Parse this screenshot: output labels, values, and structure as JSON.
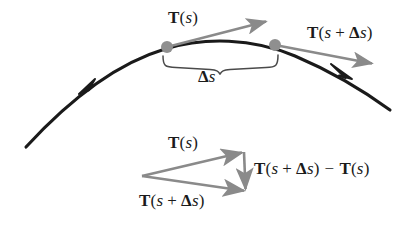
{
  "figure": {
    "name": "tangent-vector-change-along-curve",
    "background_color": "#ffffff",
    "curve_color": "#1a1a1a",
    "vector_color": "#8a8a8a",
    "point_color": "#8f8f8f",
    "brace_color": "#4a4a4a",
    "text_color": "#1b1b1b"
  },
  "labels": {
    "tangent_at_s_curve": {
      "vec": "T",
      "open": "(",
      "arg": "s",
      "close": ")",
      "full_text": "T(s)"
    },
    "tangent_at_s_plus_ds_curve": {
      "vec": "T",
      "open": "(",
      "arg": "s",
      "plus": "+",
      "delta": "Δ",
      "arg2": "s",
      "close": ")",
      "full_text": "T(s + Δs)"
    },
    "arc_length": {
      "delta": "Δ",
      "var": "s",
      "full_text": "Δs"
    },
    "tangent_at_s_triangle": {
      "vec": "T",
      "open": "(",
      "arg": "s",
      "close": ")",
      "full_text": "T(s)"
    },
    "tangent_at_s_plus_ds_triangle": {
      "vec": "T",
      "open": "(",
      "arg": "s",
      "plus": "+",
      "delta": "Δ",
      "arg2": "s",
      "close": ")",
      "full_text": "T(s + Δs)"
    },
    "tangent_difference": {
      "vec1": "T",
      "open1": "(",
      "arg1": "s",
      "plus": "+",
      "delta": "Δ",
      "arg1b": "s",
      "close1": ")",
      "minus": "−",
      "vec2": "T",
      "open2": "(",
      "arg2": "s",
      "close2": ")",
      "full_text": "T(s + Δs) − T(s)"
    }
  },
  "geometry": {
    "curve": {
      "start": [
        26,
        147
      ],
      "apex": [
        240,
        41
      ],
      "end": [
        390,
        110
      ],
      "direction_arrow_at": [
        88,
        84
      ],
      "second_arrow_at": [
        344,
        73
      ]
    },
    "points": [
      {
        "name": "point-at-s",
        "x": 167,
        "y": 47,
        "r": 6
      },
      {
        "name": "point-at-s-plus-ds",
        "x": 275,
        "y": 45,
        "r": 6
      }
    ],
    "vectors": [
      {
        "name": "tangent-vector-at-s",
        "from": [
          167,
          47
        ],
        "to": [
          268,
          21
        ]
      },
      {
        "name": "tangent-vector-at-s-plus-ds",
        "from": [
          275,
          45
        ],
        "to": [
          374,
          64
        ]
      },
      {
        "name": "triangle-tangent-at-s",
        "from": [
          142,
          176
        ],
        "to": [
          244,
          152
        ]
      },
      {
        "name": "triangle-tangent-at-s-plus-ds",
        "from": [
          142,
          176
        ],
        "to": [
          246,
          191
        ]
      },
      {
        "name": "triangle-difference-vector",
        "from": [
          244,
          152
        ],
        "to": [
          246,
          191
        ]
      }
    ],
    "brace": {
      "left_x": 162,
      "right_x": 277,
      "top_y": 57,
      "depth_y": 72
    }
  }
}
